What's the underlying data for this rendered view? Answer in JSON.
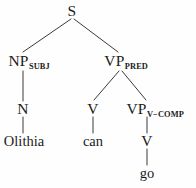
{
  "figure": {
    "kind": "phrase-structure-tree",
    "background_color": "#fefefe",
    "line_color": "#3a3a3a",
    "text_color": "#1b1b1b",
    "sentence": "Olithia can go"
  },
  "nodes": {
    "s": {
      "label": "S",
      "subscript": "",
      "x": 72,
      "y": 11
    },
    "np_subj": {
      "label": "NP",
      "subscript": "SUBJ",
      "x": 29,
      "y": 61
    },
    "vp_pred": {
      "label": "VP",
      "subscript": "PRED",
      "x": 126,
      "y": 61
    },
    "n": {
      "label": "N",
      "subscript": "",
      "x": 23,
      "y": 109
    },
    "v_can": {
      "label": "V",
      "subscript": "",
      "x": 93,
      "y": 109
    },
    "vp_vcomp": {
      "label": "VP",
      "subscript": "V−COMP",
      "x": 155,
      "y": 109
    },
    "v_go": {
      "label": "V",
      "subscript": "",
      "x": 147,
      "y": 141
    }
  },
  "leaves": {
    "olithia": {
      "text": "Olithia",
      "x": 24,
      "y": 141
    },
    "can": {
      "text": "can",
      "x": 93,
      "y": 141
    },
    "go": {
      "text": "go",
      "x": 147,
      "y": 173
    }
  },
  "edges": [
    {
      "name": "s-to-np-subj",
      "x1": 71,
      "y1": 19,
      "x2": 23,
      "y2": 52
    },
    {
      "name": "s-to-vp-pred",
      "x1": 74,
      "y1": 19,
      "x2": 118,
      "y2": 52
    },
    {
      "name": "np-subj-to-n",
      "x1": 23,
      "y1": 71,
      "x2": 23,
      "y2": 101
    },
    {
      "name": "n-to-olithia",
      "x1": 23,
      "y1": 117,
      "x2": 23,
      "y2": 133
    },
    {
      "name": "vp-pred-to-v",
      "x1": 119,
      "y1": 71,
      "x2": 94,
      "y2": 100
    },
    {
      "name": "vp-pred-to-vp-vcomp",
      "x1": 122,
      "y1": 71,
      "x2": 146,
      "y2": 100
    },
    {
      "name": "v-to-can",
      "x1": 93,
      "y1": 117,
      "x2": 93,
      "y2": 133
    },
    {
      "name": "vp-vcomp-to-v",
      "x1": 147,
      "y1": 117,
      "x2": 147,
      "y2": 133
    },
    {
      "name": "v-to-go",
      "x1": 147,
      "y1": 149,
      "x2": 147,
      "y2": 165
    }
  ]
}
